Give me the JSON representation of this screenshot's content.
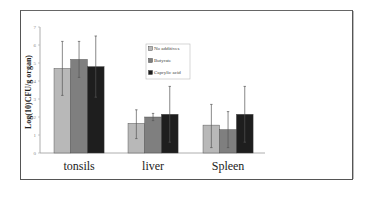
{
  "chart_data": {
    "type": "bar",
    "title": "",
    "xlabel": "",
    "ylabel": "Log(10)CFU/g organ)",
    "ylim": [
      0,
      7
    ],
    "yticks": [
      "0",
      "1",
      "2",
      "3",
      "4",
      "5",
      "6",
      "7"
    ],
    "grid": false,
    "legend_position": "inside-top-center",
    "categories": [
      "tonsils",
      "liver",
      "Spleen"
    ],
    "series": [
      {
        "name": "No additives",
        "color": "#b8b8b8",
        "values": [
          4.7,
          1.65,
          1.55
        ],
        "error_upper": [
          6.2,
          2.4,
          2.7
        ],
        "error_lower": [
          3.2,
          0.8,
          0.3
        ]
      },
      {
        "name": "Butyrate",
        "color": "#7f7f7f",
        "values": [
          5.2,
          2.0,
          1.3
        ],
        "error_upper": [
          6.2,
          2.2,
          2.3
        ],
        "error_lower": [
          4.2,
          1.8,
          0.3
        ]
      },
      {
        "name": "Caprylic acid",
        "color": "#1e1e1e",
        "values": [
          4.8,
          2.15,
          2.15
        ],
        "error_upper": [
          6.5,
          3.7,
          3.7
        ],
        "error_lower": [
          3.1,
          0.6,
          0.6
        ]
      }
    ]
  }
}
